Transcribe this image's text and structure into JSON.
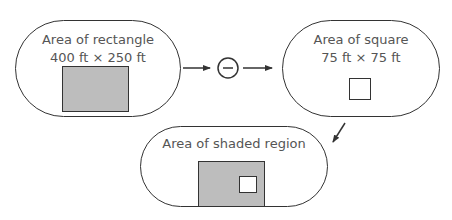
{
  "diagram": {
    "nodes": [
      {
        "id": "rectangle",
        "title": "Area of rectangle",
        "subtitle": "400 ft × 250 ft",
        "shape": "shaded-rectangle"
      },
      {
        "id": "square",
        "title": "Area of square",
        "subtitle": "75 ft × 75 ft",
        "shape": "empty-square"
      },
      {
        "id": "shaded",
        "title": "Area of shaded region",
        "subtitle": "",
        "shape": "shaded-rectangle-with-square-hole"
      }
    ],
    "operator": {
      "symbol": "−",
      "name": "minus"
    },
    "edges": [
      {
        "from": "rectangle",
        "to": "operator"
      },
      {
        "from": "operator",
        "to": "square"
      },
      {
        "from": "square",
        "to": "shaded"
      }
    ],
    "colors": {
      "shade": "#bdbdbd",
      "stroke": "#333333",
      "text": "#555555"
    }
  }
}
